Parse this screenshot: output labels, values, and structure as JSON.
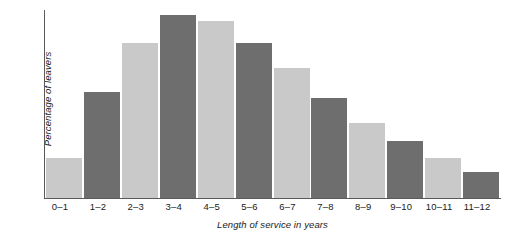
{
  "chart_data": {
    "type": "bar",
    "title": "",
    "xlabel": "Length of service in years",
    "ylabel": "Percentage of leavers",
    "categories": [
      "0–1",
      "1–2",
      "2–3",
      "3–4",
      "4–5",
      "5–6",
      "6–7",
      "7–8",
      "8–9",
      "9–10",
      "10–11",
      "11–12"
    ],
    "values": [
      22,
      58,
      85,
      100,
      97,
      85,
      71,
      55,
      41,
      31,
      22,
      14
    ],
    "bar_colors": [
      "#c9c9c9",
      "#6e6e6e",
      "#c9c9c9",
      "#6e6e6e",
      "#c9c9c9",
      "#6e6e6e",
      "#c9c9c9",
      "#6e6e6e",
      "#c9c9c9",
      "#6e6e6e",
      "#c9c9c9",
      "#6e6e6e"
    ],
    "ylim": [
      0,
      103
    ],
    "grid": false,
    "legend": null,
    "axis_color": "#5a5a5a",
    "background": "#ffffff"
  }
}
